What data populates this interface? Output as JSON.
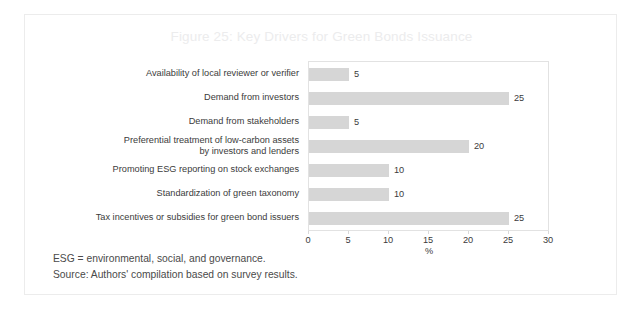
{
  "figure": {
    "title": "Figure 25: Key Drivers for Green Bonds Issuance",
    "notes": [
      "ESG = environmental, social, and governance.",
      "Source: Authors' compilation based on survey results."
    ]
  },
  "chart_data": {
    "type": "bar",
    "orientation": "horizontal",
    "title": "Figure 25: Key Drivers for Green Bonds Issuance",
    "xlabel": "%",
    "ylabel": "",
    "xlim": [
      0,
      30
    ],
    "xticks": [
      "0",
      "5",
      "10",
      "15",
      "20",
      "25",
      "30"
    ],
    "grid": false,
    "legend": null,
    "bar_color": "#d6d6d6",
    "categories": [
      "Availability of local reviewer or verifier",
      "Demand from investors",
      "Demand from stakeholders",
      "Preferential treatment of low-carbon assets\nby investors and lenders",
      "Promoting ESG reporting on stock exchanges",
      "Standardization of green taxonomy",
      "Tax incentives or subsidies for green bond issuers"
    ],
    "values": [
      5,
      25,
      5,
      20,
      10,
      10,
      25
    ],
    "value_labels": [
      "5",
      "25",
      "5",
      "20",
      "10",
      "10",
      "25"
    ]
  }
}
